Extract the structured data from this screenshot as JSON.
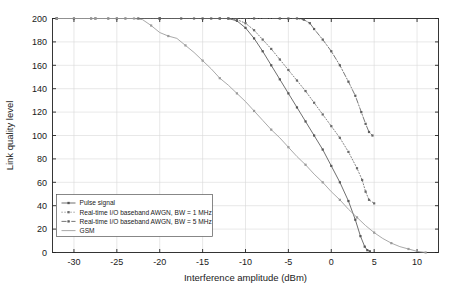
{
  "chart_data": {
    "type": "line",
    "title": "",
    "xlabel": "Interference amplitude (dBm)",
    "ylabel": "Link quality level",
    "xlim": [
      -32.5,
      12.5
    ],
    "ylim": [
      0,
      200
    ],
    "xticks": [
      -30,
      -25,
      -20,
      -15,
      -10,
      -5,
      0,
      5,
      10
    ],
    "yticks": [
      0,
      20,
      40,
      60,
      80,
      100,
      120,
      140,
      160,
      180,
      200
    ],
    "xtick_labels": [
      "-30",
      "-25",
      "-20",
      "-15",
      "-10",
      "-5",
      "0",
      "5",
      "10"
    ],
    "ytick_labels": [
      "0",
      "20",
      "40",
      "60",
      "80",
      "100",
      "120",
      "140",
      "160",
      "180",
      "200"
    ],
    "grid": true,
    "legend_position": "lower left",
    "series": [
      {
        "name": "Pulse signal",
        "style": "solid-marker",
        "color": "#555555",
        "marker": "square",
        "points": [
          [
            -32.0,
            200
          ],
          [
            -30.0,
            200
          ],
          [
            -27.5,
            200
          ],
          [
            -25.0,
            200
          ],
          [
            -22.5,
            200
          ],
          [
            -20.0,
            200
          ],
          [
            -17.5,
            200
          ],
          [
            -15.0,
            200
          ],
          [
            -13.0,
            200
          ],
          [
            -12.0,
            200
          ],
          [
            -11.0,
            198
          ],
          [
            -10.0,
            192
          ],
          [
            -9.0,
            183
          ],
          [
            -8.0,
            172
          ],
          [
            -7.0,
            160
          ],
          [
            -6.0,
            148
          ],
          [
            -5.0,
            136
          ],
          [
            -4.0,
            124
          ],
          [
            -3.0,
            112
          ],
          [
            -2.0,
            100
          ],
          [
            -1.0,
            88
          ],
          [
            0.0,
            74
          ],
          [
            1.0,
            60
          ],
          [
            2.0,
            44
          ],
          [
            2.8,
            28
          ],
          [
            3.4,
            14
          ],
          [
            3.9,
            5
          ],
          [
            4.2,
            2
          ],
          [
            4.5,
            1
          ]
        ]
      },
      {
        "name": "Real-time I/O baseband AWGN, BW = 1 MHz",
        "style": "dotted",
        "color": "#6a6a6a",
        "marker": "square",
        "points": [
          [
            -32.0,
            200
          ],
          [
            -28.0,
            200
          ],
          [
            -24.0,
            200
          ],
          [
            -20.0,
            200
          ],
          [
            -16.0,
            200
          ],
          [
            -13.0,
            200
          ],
          [
            -12.0,
            200
          ],
          [
            -11.0,
            199
          ],
          [
            -10.0,
            196
          ],
          [
            -9.0,
            190
          ],
          [
            -8.0,
            182
          ],
          [
            -7.0,
            174
          ],
          [
            -6.0,
            165
          ],
          [
            -5.0,
            156
          ],
          [
            -4.0,
            147
          ],
          [
            -3.0,
            138
          ],
          [
            -2.0,
            128
          ],
          [
            -1.0,
            118
          ],
          [
            0.0,
            108
          ],
          [
            1.0,
            98
          ],
          [
            2.0,
            86
          ],
          [
            3.0,
            72
          ],
          [
            3.6,
            62
          ],
          [
            4.0,
            52
          ],
          [
            4.4,
            45
          ],
          [
            5.0,
            42
          ]
        ]
      },
      {
        "name": "Real-time I/O baseband AWGN, BW = 5 MHz",
        "style": "dash-dot",
        "color": "#5f5f5f",
        "marker": "square",
        "points": [
          [
            -32.0,
            200
          ],
          [
            -26.0,
            200
          ],
          [
            -20.0,
            200
          ],
          [
            -14.0,
            200
          ],
          [
            -9.0,
            200
          ],
          [
            -6.0,
            200
          ],
          [
            -5.0,
            200
          ],
          [
            -4.0,
            200
          ],
          [
            -3.2,
            199
          ],
          [
            -2.5,
            196
          ],
          [
            -2.0,
            191
          ],
          [
            -1.0,
            182
          ],
          [
            0.0,
            172
          ],
          [
            1.0,
            160
          ],
          [
            2.0,
            146
          ],
          [
            2.8,
            134
          ],
          [
            3.5,
            120
          ],
          [
            4.0,
            110
          ],
          [
            4.4,
            103
          ],
          [
            4.8,
            100
          ]
        ]
      },
      {
        "name": "GSM",
        "style": "solid",
        "color": "#9a9a9a",
        "marker": "square",
        "points": [
          [
            -32.0,
            200
          ],
          [
            -30.0,
            200
          ],
          [
            -27.5,
            200
          ],
          [
            -25.0,
            200
          ],
          [
            -23.0,
            200
          ],
          [
            -22.0,
            199
          ],
          [
            -21.0,
            194
          ],
          [
            -20.0,
            188
          ],
          [
            -19.0,
            185
          ],
          [
            -18.0,
            183
          ],
          [
            -17.0,
            177
          ],
          [
            -16.0,
            171
          ],
          [
            -15.0,
            164
          ],
          [
            -14.0,
            157
          ],
          [
            -13.0,
            149
          ],
          [
            -12.0,
            143
          ],
          [
            -11.0,
            136
          ],
          [
            -10.0,
            129
          ],
          [
            -9.0,
            121
          ],
          [
            -8.0,
            113
          ],
          [
            -7.0,
            105
          ],
          [
            -6.0,
            98
          ],
          [
            -5.0,
            90
          ],
          [
            -4.0,
            82
          ],
          [
            -3.0,
            75
          ],
          [
            -2.0,
            67
          ],
          [
            -1.0,
            60
          ],
          [
            0.0,
            52
          ],
          [
            1.0,
            45
          ],
          [
            2.0,
            37
          ],
          [
            3.0,
            30
          ],
          [
            4.0,
            23
          ],
          [
            5.0,
            17
          ],
          [
            6.0,
            12
          ],
          [
            7.0,
            8
          ],
          [
            8.0,
            5
          ],
          [
            9.0,
            3
          ],
          [
            10.0,
            1
          ],
          [
            11.0,
            0
          ]
        ]
      }
    ]
  },
  "legend": {
    "entries": [
      {
        "label": "Pulse signal"
      },
      {
        "label": "Real-time I/O baseband AWGN, BW = 1 MHz"
      },
      {
        "label": "Real-time I/O baseband AWGN, BW = 5 MHz"
      },
      {
        "label": "GSM"
      }
    ]
  }
}
